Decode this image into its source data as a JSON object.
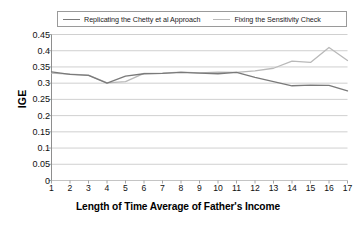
{
  "chart_data": {
    "type": "line",
    "title": "",
    "xlabel": "Length of Time Average of Father's Income",
    "ylabel": "IGE",
    "xlim": [
      1,
      17
    ],
    "ylim": [
      0,
      0.45
    ],
    "ytick_step": 0.05,
    "grid": true,
    "legend_position": "top",
    "categories": [
      1,
      2,
      3,
      4,
      5,
      6,
      7,
      8,
      9,
      10,
      11,
      12,
      13,
      14,
      15,
      16,
      17
    ],
    "xticklabels": [
      "1",
      "2",
      "3",
      "4",
      "5",
      "6",
      "7",
      "8",
      "9",
      "10",
      "11",
      "12",
      "13",
      "14",
      "15",
      "16",
      "17"
    ],
    "yticklabels": [
      "0",
      "0.05",
      "0.1",
      "0.15",
      "0.2",
      "0.25",
      "0.3",
      "0.35",
      "0.4",
      "0.45"
    ],
    "series": [
      {
        "name": "Replicating the Chetty et al Approach",
        "color": "#7a7a7a",
        "values": [
          0.335,
          0.327,
          0.324,
          0.3,
          0.322,
          0.329,
          0.33,
          0.333,
          0.331,
          0.329,
          0.333,
          0.318,
          0.305,
          0.292,
          0.294,
          0.293,
          0.276
        ]
      },
      {
        "name": "Fixing the Sensitivity Check",
        "color": "#b9b9b9",
        "values": [
          0.331,
          0.328,
          0.325,
          0.301,
          0.305,
          0.33,
          0.331,
          0.334,
          0.332,
          0.334,
          0.333,
          0.338,
          0.346,
          0.368,
          0.364,
          0.41,
          0.37
        ]
      }
    ]
  },
  "legend": {
    "entries": [
      {
        "label": "Replicating the Chetty et al Approach"
      },
      {
        "label": "Fixing the Sensitivity Check"
      }
    ]
  },
  "axes": {
    "y_title": "IGE",
    "x_title": "Length of Time Average of Father's Income"
  }
}
